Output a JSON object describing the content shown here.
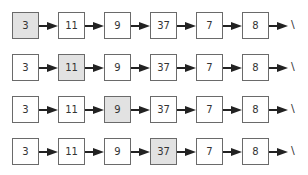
{
  "diagram": {
    "title": "",
    "rows": [
      {
        "nodes": [
          "3",
          "11",
          "9",
          "37",
          "7",
          "8"
        ],
        "highlight_index": 0,
        "terminator": "\\"
      },
      {
        "nodes": [
          "3",
          "11",
          "9",
          "37",
          "7",
          "8"
        ],
        "highlight_index": 1,
        "terminator": "\\"
      },
      {
        "nodes": [
          "3",
          "11",
          "9",
          "37",
          "7",
          "8"
        ],
        "highlight_index": 2,
        "terminator": "\\"
      },
      {
        "nodes": [
          "3",
          "11",
          "9",
          "37",
          "7",
          "8"
        ],
        "highlight_index": 3,
        "terminator": "\\"
      }
    ],
    "colors": {
      "highlight": "#e2e2e2",
      "node_border": "#6a6a6a",
      "arrow": "#222222"
    }
  }
}
